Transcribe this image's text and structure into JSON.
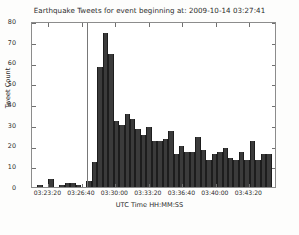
{
  "chart_data": {
    "type": "bar",
    "title": "Earthquake Tweets for event beginning at: 2009-10-14 03:27:41",
    "xlabel": "UTC Time HH:MM:SS",
    "ylabel": "Tweet Count",
    "ylim": [
      0,
      80
    ],
    "yticks": [
      0,
      10,
      20,
      30,
      40,
      50,
      60,
      70,
      80
    ],
    "ytick_labels": [
      "0",
      "10",
      "20",
      "30",
      "40",
      "50",
      "60",
      "70",
      "80"
    ],
    "xtick_labels": [
      "03:23:20",
      "03:26:40",
      "03:30:00",
      "03:33:20",
      "03:36:40",
      "03:40:00",
      "03:43:20"
    ],
    "xtick_positions": [
      0.0667,
      0.2034,
      0.3401,
      0.4768,
      0.6136,
      0.7503,
      0.887
    ],
    "grid": false,
    "legend": null,
    "bar_color": "#3b3b3b",
    "event_marker": {
      "label": "2009-10-14 03:27:41",
      "position": 0.2245,
      "color": "#787878"
    },
    "bin_count": 45,
    "values": [
      0,
      1,
      0,
      4,
      0,
      1,
      2,
      2,
      1,
      0,
      3,
      12,
      58,
      74,
      64,
      32,
      30,
      35,
      33,
      28,
      25,
      29,
      22,
      22,
      23,
      27,
      16,
      20,
      17,
      17,
      24,
      18,
      13,
      16,
      17,
      19,
      14,
      13,
      17,
      13,
      22,
      13,
      16,
      16,
      0
    ],
    "categories": [
      "03:22:30",
      "03:23:00",
      "03:23:30",
      "03:24:00",
      "03:24:30",
      "03:25:00",
      "03:25:30",
      "03:26:00",
      "03:26:30",
      "03:27:00",
      "03:27:30",
      "03:28:00",
      "03:28:30",
      "03:29:00",
      "03:29:30",
      "03:30:00",
      "03:30:30",
      "03:31:00",
      "03:31:30",
      "03:32:00",
      "03:32:30",
      "03:33:00",
      "03:33:30",
      "03:34:00",
      "03:34:30",
      "03:35:00",
      "03:35:30",
      "03:36:00",
      "03:36:30",
      "03:37:00",
      "03:37:30",
      "03:38:00",
      "03:38:30",
      "03:39:00",
      "03:39:30",
      "03:40:00",
      "03:40:30",
      "03:41:00",
      "03:41:30",
      "03:42:00",
      "03:42:30",
      "03:43:00",
      "03:43:30",
      "03:44:00",
      "03:44:30"
    ]
  }
}
